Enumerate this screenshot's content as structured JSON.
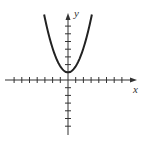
{
  "chart_data": {
    "type": "line",
    "title": "",
    "xlabel": "x",
    "ylabel": "y",
    "series": [
      {
        "name": "y = x^2 + 1",
        "x": [
          -3,
          -2.5,
          -2,
          -1.5,
          -1,
          -0.5,
          0,
          0.5,
          1,
          1.5,
          2,
          2.5,
          3
        ],
        "values": [
          10,
          7.25,
          5,
          3.25,
          2,
          1.25,
          1,
          1.25,
          2,
          3.25,
          5,
          7.25,
          10
        ]
      }
    ],
    "xlim": [
      -8,
      8
    ],
    "ylim": [
      -8,
      9
    ],
    "grid": false,
    "tick_spacing": 1
  },
  "labels": {
    "x_axis": "x",
    "y_axis": "y"
  }
}
